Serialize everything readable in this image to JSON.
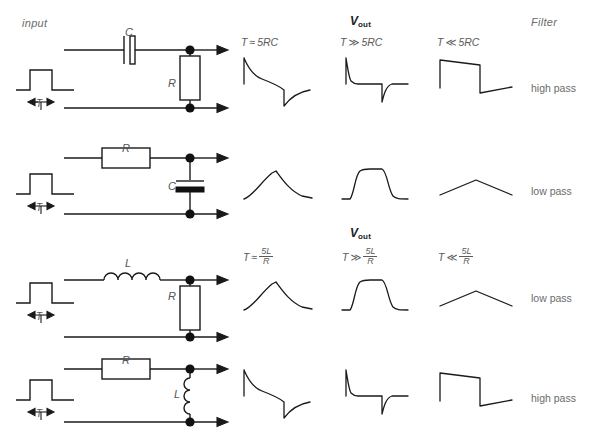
{
  "headers": {
    "input": "input",
    "vout": "V",
    "vout_sub": "out",
    "filter": "Filter"
  },
  "rows": [
    {
      "id": "row-rc-highpass",
      "series_component": "C",
      "shunt_component": "R",
      "input_label": "T",
      "filter_type": "high pass",
      "conditions": [
        {
          "var": "T",
          "op": "≈",
          "tau": "5RC",
          "kind": "inline"
        },
        {
          "var": "T",
          "op": "≫",
          "tau": "5RC",
          "kind": "inline"
        },
        {
          "var": "T",
          "op": "≪",
          "tau": "5RC",
          "kind": "inline"
        }
      ]
    },
    {
      "id": "row-rc-lowpass",
      "series_component": "R",
      "shunt_component": "C",
      "input_label": "T",
      "filter_type": "low pass",
      "conditions": []
    },
    {
      "id": "row-lr-lowpass",
      "series_component": "L",
      "shunt_component": "R",
      "input_label": "T",
      "filter_type": "low pass",
      "conditions": [
        {
          "var": "T",
          "op": "≈",
          "num": "5L",
          "den": "R",
          "kind": "fraction"
        },
        {
          "var": "T",
          "op": "≫",
          "num": "5L",
          "den": "R",
          "kind": "fraction"
        },
        {
          "var": "T",
          "op": "≪",
          "num": "5L",
          "den": "R",
          "kind": "fraction"
        }
      ]
    },
    {
      "id": "row-rl-highpass",
      "series_component": "R",
      "shunt_component": "L",
      "input_label": "T",
      "filter_type": "high pass",
      "conditions": []
    }
  ],
  "colors": {
    "ink": "#1a1a1a",
    "text": "#5a5a5a",
    "muted": "#6b6b6b",
    "background": "#ffffff"
  }
}
